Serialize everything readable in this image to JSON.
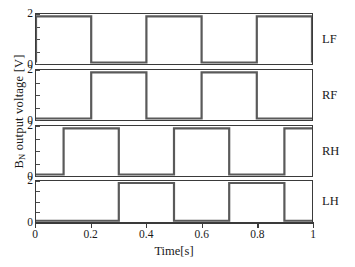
{
  "chart_data": {
    "type": "line",
    "title": "",
    "subtitle": "",
    "xlabel": "Time[s]",
    "ylabel": "B_N output voltage [V]",
    "ylabel_base": "B",
    "ylabel_sub": "N",
    "ylabel_rest": " output voltage [V]",
    "xlim": [
      0,
      1
    ],
    "ylim": [
      0,
      2
    ],
    "xticks": [
      0,
      0.2,
      0.4,
      0.6,
      0.8,
      1
    ],
    "xticklabels": [
      "0",
      "0.2",
      "0.4",
      "0.6",
      "0.8",
      "1"
    ],
    "yticks": [
      0,
      2
    ],
    "yticklabels": [
      "0",
      "2"
    ],
    "grid": false,
    "legend_position": "right-outside",
    "line_color": "#5a5a5a",
    "axis_color": "#3a3a3a",
    "background": "#ffffff",
    "signal_high": 1.9,
    "signal_low": 0,
    "series": [
      {
        "name": "LF",
        "label": "LF",
        "panel": 0,
        "pulses": [
          [
            0.0,
            0.2
          ],
          [
            0.4,
            0.6
          ],
          [
            0.8,
            1.0
          ]
        ],
        "x": [
          0,
          0,
          0.2,
          0.2,
          0.4,
          0.4,
          0.6,
          0.6,
          0.8,
          0.8,
          1.0,
          1.0
        ],
        "values": [
          0,
          1.9,
          1.9,
          0,
          0,
          1.9,
          1.9,
          0,
          0,
          1.9,
          1.9,
          0
        ]
      },
      {
        "name": "RF",
        "label": "RF",
        "panel": 1,
        "pulses": [
          [
            0.2,
            0.4
          ],
          [
            0.6,
            0.8
          ]
        ],
        "x": [
          0,
          0.2,
          0.2,
          0.4,
          0.4,
          0.6,
          0.6,
          0.8,
          0.8,
          1.0
        ],
        "values": [
          0,
          0,
          1.9,
          1.9,
          0,
          0,
          1.9,
          1.9,
          0,
          0
        ]
      },
      {
        "name": "RH",
        "label": "RH",
        "panel": 2,
        "pulses": [
          [
            0.1,
            0.3
          ],
          [
            0.5,
            0.7
          ],
          [
            0.9,
            1.0
          ]
        ],
        "x": [
          0,
          0.1,
          0.1,
          0.3,
          0.3,
          0.5,
          0.5,
          0.7,
          0.7,
          0.9,
          0.9,
          1.0
        ],
        "values": [
          0,
          0,
          1.9,
          1.9,
          0,
          0,
          1.9,
          1.9,
          0,
          0,
          1.9,
          1.9
        ]
      },
      {
        "name": "LH",
        "label": "LH",
        "panel": 3,
        "pulses": [
          [
            0.3,
            0.5
          ],
          [
            0.7,
            0.9
          ]
        ],
        "x": [
          0,
          0.3,
          0.3,
          0.5,
          0.5,
          0.7,
          0.7,
          0.9,
          0.9,
          1.0
        ],
        "values": [
          0,
          0,
          1.9,
          1.9,
          0,
          0,
          1.9,
          1.9,
          0,
          0
        ]
      }
    ]
  }
}
